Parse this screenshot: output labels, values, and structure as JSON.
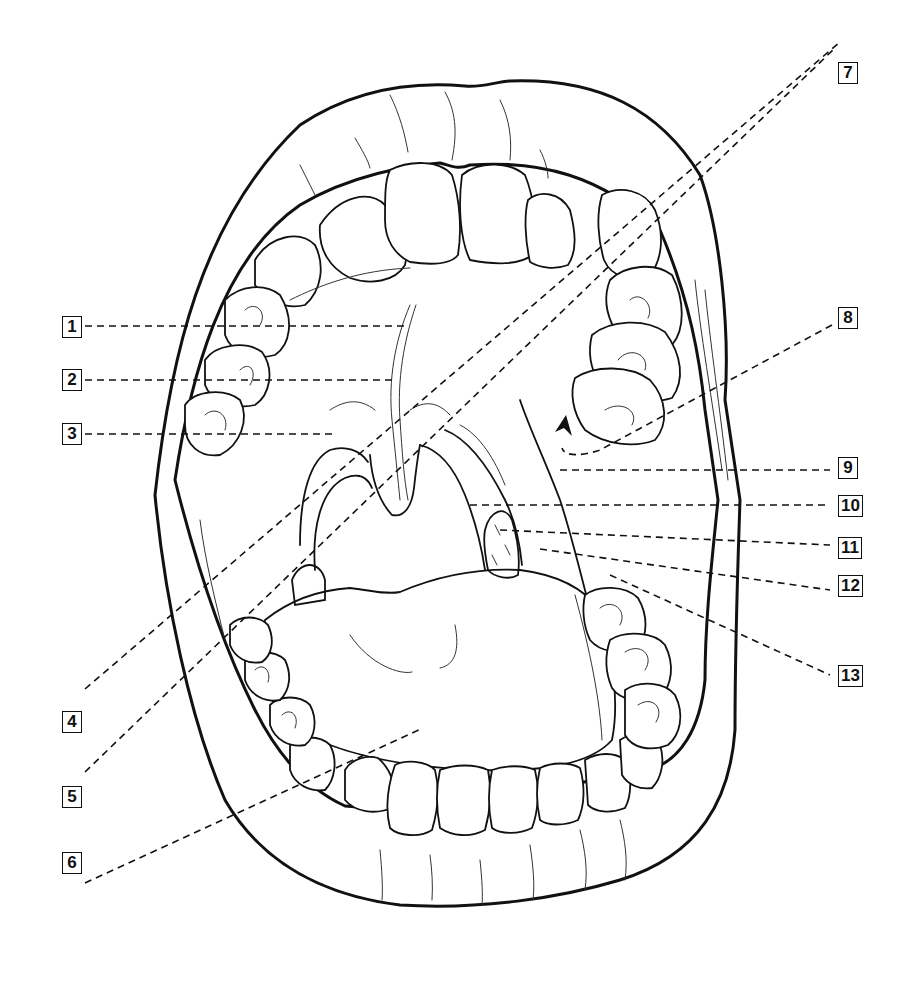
{
  "diagram": {
    "labels": [
      {
        "id": "1",
        "text": "1",
        "side": "left"
      },
      {
        "id": "2",
        "text": "2",
        "side": "left"
      },
      {
        "id": "3",
        "text": "3",
        "side": "left"
      },
      {
        "id": "4",
        "text": "4",
        "side": "left"
      },
      {
        "id": "5",
        "text": "5",
        "side": "left"
      },
      {
        "id": "6",
        "text": "6",
        "side": "left"
      },
      {
        "id": "7",
        "text": "7",
        "side": "right"
      },
      {
        "id": "8",
        "text": "8",
        "side": "right"
      },
      {
        "id": "9",
        "text": "9",
        "side": "right"
      },
      {
        "id": "10",
        "text": "10",
        "side": "right"
      },
      {
        "id": "11",
        "text": "11",
        "side": "right"
      },
      {
        "id": "12",
        "text": "12",
        "side": "right"
      },
      {
        "id": "13",
        "text": "13",
        "side": "right"
      }
    ],
    "colors": {
      "line": "#111111",
      "background": "#ffffff"
    }
  }
}
